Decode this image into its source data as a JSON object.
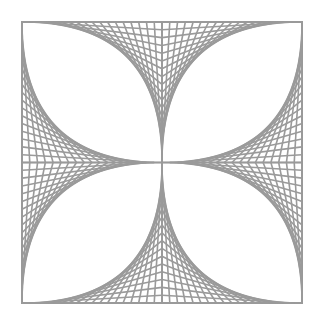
{
  "figure": {
    "background": "#ffffff",
    "stroke_color": "#9a9a9a",
    "stroke_width": 1.6,
    "square": {
      "x0": 22,
      "y0": 22,
      "x1": 302,
      "y1": 303
    },
    "lines_per_family": 18,
    "petals": [
      "top-left",
      "top-right",
      "bottom-right",
      "bottom-left"
    ]
  }
}
